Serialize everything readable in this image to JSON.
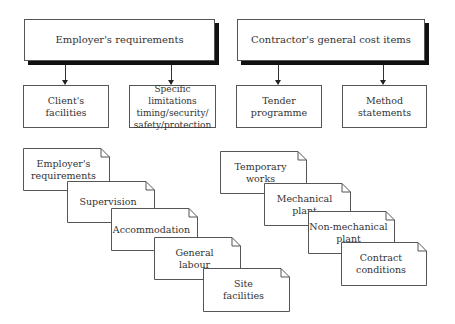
{
  "left_group": {
    "header": "Employer's requirements",
    "children": [
      "Client's\nfacilities",
      "Specific limitations\ntiming/security/\nsafety/protection"
    ],
    "documents": [
      "Employer's\nrequirements",
      "Supervision",
      "Accommodation",
      "General\nlabour",
      "Site\nfacilities"
    ]
  },
  "right_group": {
    "header": "Contractor's general cost items",
    "children": [
      "Tender\nprogramme",
      "Method\nstatements"
    ],
    "documents": [
      "Temporary\nworks",
      "Mechanical\nplant",
      "Non-mechanical\nplant",
      "Contract\nconditions"
    ]
  },
  "colors": {
    "border": "#555555",
    "shadow": "#111111",
    "text": "#333333"
  }
}
